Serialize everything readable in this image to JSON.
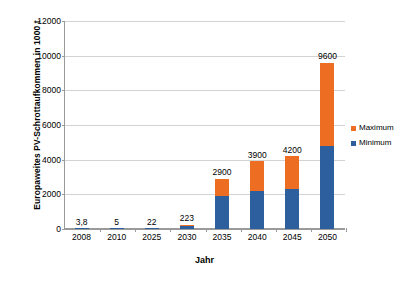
{
  "chart_data": {
    "type": "bar",
    "subtype": "stacked-bar",
    "title": "",
    "xlabel": "Jahr",
    "ylabel": "Europaweites PV-Schrottaufkommen in 1000 t",
    "categories": [
      "2008",
      "2010",
      "2025",
      "2030",
      "2035",
      "2040",
      "2045",
      "2050"
    ],
    "series": [
      {
        "name": "Minimum",
        "color": "#2D5E9E",
        "values": [
          3.8,
          5,
          22,
          150,
          1900,
          2200,
          2300,
          4800
        ]
      },
      {
        "name": "Maximum",
        "color": "#ED6E22",
        "values": [
          0,
          0,
          0,
          73,
          1000,
          1700,
          1900,
          4800
        ]
      }
    ],
    "totals": [
      3.8,
      5,
      22,
      223,
      2900,
      3900,
      4200,
      9600
    ],
    "point_labels": [
      "3,8",
      "5",
      "22",
      "223",
      "2900",
      "3900",
      "4200",
      "9600"
    ],
    "ylim": [
      0,
      12000
    ],
    "yticks": [
      0,
      2000,
      4000,
      6000,
      8000,
      10000,
      12000
    ],
    "ytick_labels": [
      "0",
      "2000",
      "4000",
      "6000",
      "8000",
      "10000",
      "12000"
    ],
    "grid": true,
    "legend_position": "right",
    "legend": [
      {
        "label": "Maximum",
        "color": "#ED6E22"
      },
      {
        "label": "Minimum",
        "color": "#2D5E9E"
      }
    ]
  }
}
